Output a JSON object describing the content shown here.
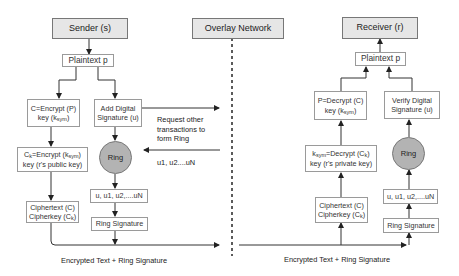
{
  "sender": {
    "title": "Sender (s)",
    "plaintext": "Plaintext p",
    "encrypt_line1": "C=Encrypt (P)",
    "encrypt_line2_pre": "key (k",
    "encrypt_line2_sub": "sym",
    "encrypt_line2_post": ")",
    "add_sig_line1": "Add Digital",
    "add_sig_line2": "Signature (u)",
    "ring": "Ring",
    "ck_line1_pre": "C",
    "ck_line1_sub": "k",
    "ck_line1_mid": "=Encrypt (k",
    "ck_line1_sub2": "sym",
    "ck_line1_post": ")",
    "ck_line2": "key (r's public key)",
    "members": "u, u1, u2,....uN",
    "cipher_line1": "Ciphertext (C)",
    "cipher_line2_pre": "Cipherkey (C",
    "cipher_line2_sub": "k",
    "cipher_line2_post": ")",
    "ring_signature": "Ring Signature",
    "bottom_label": "Encrypted Text + Ring Signature"
  },
  "overlay": {
    "title": "Overlay Network",
    "request_label_line1": "Request other",
    "request_label_line2": "transactions to",
    "request_label_line3": "form Ring",
    "return_label": "u1, u2....uN"
  },
  "receiver": {
    "title": "Receiver (r)",
    "plaintext": "Plaintext p",
    "decrypt_line1": "P=Decrypt (C)",
    "decrypt_line2_pre": "key (k",
    "decrypt_line2_sub": "sym",
    "decrypt_line2_post": ")",
    "verify_line1": "Verify Digital",
    "verify_line2": "Signature (u)",
    "ksym_line1_pre": "k",
    "ksym_line1_sub": "sym",
    "ksym_line1_mid": "=Decrypt (C",
    "ksym_line1_sub2": "k",
    "ksym_line1_post": ")",
    "ksym_line2": "key (r's private key)",
    "ring": "Ring",
    "members": "u, u1, u2,....uN",
    "cipher_line1": "Ciphertext (C)",
    "cipher_line2_pre": "Cipherkey (C",
    "cipher_line2_sub": "k",
    "cipher_line2_post": ")",
    "ring_signature": "Ring Signature",
    "bottom_label": "Encrypted Text + Ring Signature"
  },
  "colors": {
    "header_fill": "#e6e6e6",
    "ring_fill": "#b3b3b3",
    "line": "#222222",
    "box_border": "#9a9a9a"
  }
}
